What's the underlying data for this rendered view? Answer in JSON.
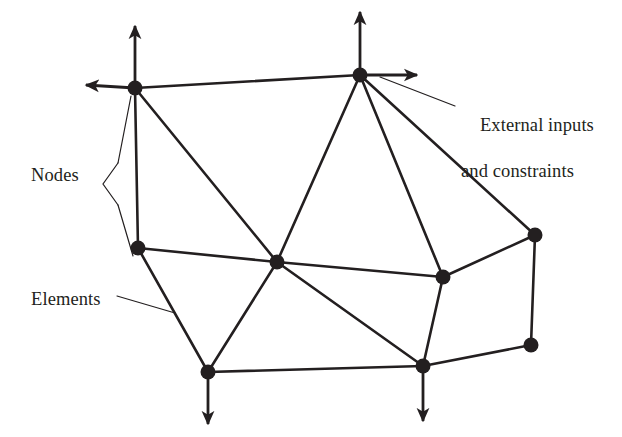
{
  "figure": {
    "kind": "finite-element-mesh-diagram",
    "background_color": "#ffffff",
    "ink_color": "#231f20",
    "width": 622,
    "height": 437
  },
  "labels": {
    "nodes": "Nodes",
    "elements": "Elements",
    "external_line1": "External inputs",
    "external_line2": "and constraints"
  },
  "diagram": {
    "node_radius": 7.5,
    "edge_width": 2.6,
    "leader_width": 1.2,
    "arrow_width": 2.8,
    "nodes": [
      {
        "id": "TL",
        "name": "node-top-left",
        "x": 135,
        "y": 88
      },
      {
        "id": "TM",
        "name": "node-top-middle",
        "x": 360,
        "y": 75
      },
      {
        "id": "LM",
        "name": "node-left-middle",
        "x": 138,
        "y": 248
      },
      {
        "id": "C",
        "name": "node-center",
        "x": 277,
        "y": 262
      },
      {
        "id": "RM",
        "name": "node-right-middle",
        "x": 443,
        "y": 277
      },
      {
        "id": "RU",
        "name": "node-right-upper",
        "x": 535,
        "y": 235
      },
      {
        "id": "BL",
        "name": "node-bottom-left",
        "x": 208,
        "y": 372
      },
      {
        "id": "BR",
        "name": "node-bottom-right",
        "x": 423,
        "y": 366
      },
      {
        "id": "RL",
        "name": "node-right-lower",
        "x": 531,
        "y": 345
      }
    ],
    "edges": [
      [
        "TL",
        "TM"
      ],
      [
        "TL",
        "LM"
      ],
      [
        "TL",
        "C"
      ],
      [
        "TM",
        "C"
      ],
      [
        "TM",
        "RM"
      ],
      [
        "TM",
        "RU"
      ],
      [
        "LM",
        "C"
      ],
      [
        "LM",
        "BL"
      ],
      [
        "C",
        "RM"
      ],
      [
        "C",
        "BL"
      ],
      [
        "C",
        "BR"
      ],
      [
        "RM",
        "RU"
      ],
      [
        "RM",
        "BR"
      ],
      [
        "RU",
        "RL"
      ],
      [
        "BL",
        "BR"
      ],
      [
        "BR",
        "RL"
      ]
    ],
    "arrows": [
      {
        "name": "arrow-up-top-left",
        "x1": 135,
        "y1": 88,
        "x2": 135,
        "y2": 26
      },
      {
        "name": "arrow-left-top-left",
        "x1": 135,
        "y1": 88,
        "x2": 86,
        "y2": 85
      },
      {
        "name": "arrow-up-top-middle",
        "x1": 360,
        "y1": 75,
        "x2": 360,
        "y2": 12
      },
      {
        "name": "arrow-right-top-middle",
        "x1": 360,
        "y1": 75,
        "x2": 417,
        "y2": 75
      },
      {
        "name": "arrow-down-bottom-left",
        "x1": 208,
        "y1": 372,
        "x2": 208,
        "y2": 424
      },
      {
        "name": "arrow-down-bottom-right",
        "x1": 423,
        "y1": 366,
        "x2": 423,
        "y2": 421
      }
    ],
    "leaders": {
      "nodes_brace": "M 118 163 L 103 184 L 118 205",
      "nodes_upper": "M 118 163 L 131 96",
      "nodes_lower": "M 118 205 L 133 256",
      "elements": "M 117 296 L 175 313",
      "external": "M 455 106 L 380 77"
    }
  }
}
